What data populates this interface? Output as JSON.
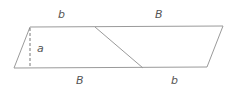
{
  "diagram": {
    "stroke_color": "#999999",
    "label_color": "#555555",
    "labels": {
      "top_left": "b",
      "top_right": "B",
      "bottom_left": "B",
      "bottom_right": "b",
      "height": "a"
    },
    "shape": {
      "parallelogram": [
        [
          30,
          27
        ],
        [
          223,
          26
        ],
        [
          207,
          67
        ],
        [
          14,
          68
        ]
      ],
      "diagonal": [
        [
          95,
          27
        ],
        [
          143,
          68
        ]
      ],
      "height_dashed": [
        [
          30,
          27
        ],
        [
          30,
          68
        ]
      ]
    }
  }
}
